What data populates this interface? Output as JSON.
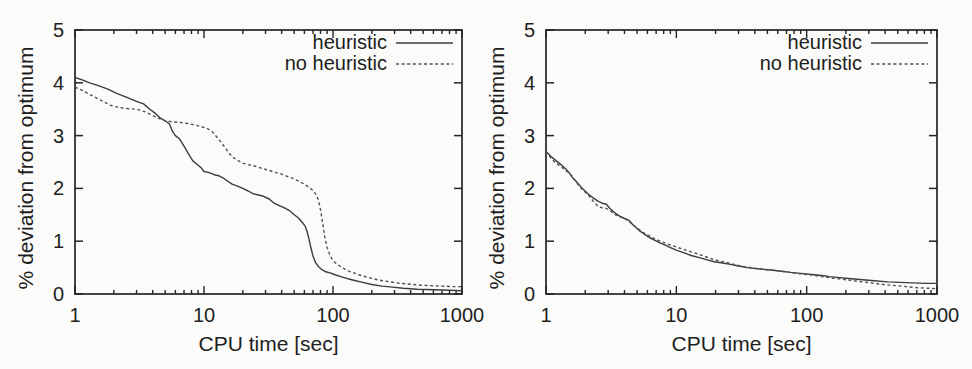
{
  "figure": {
    "background_color": "#fbfbf9",
    "ink_color": "#242424",
    "solid_line_color": "#3c3c3c",
    "dashed_line_color": "#515151"
  },
  "chart_data": [
    {
      "type": "line",
      "panel": "left",
      "title": "",
      "xlabel": "CPU time [sec]",
      "ylabel": "% deviation from optimum",
      "x_scale": "log",
      "xlim": [
        1,
        1000
      ],
      "ylim": [
        0,
        5
      ],
      "x_ticks": [
        1,
        10,
        100,
        1000
      ],
      "y_ticks": [
        0,
        1,
        2,
        3,
        4,
        5
      ],
      "grid": false,
      "legend_position": "top-right",
      "series": [
        {
          "name": "heuristic",
          "style": "solid",
          "points": [
            [
              1,
              4.1
            ],
            [
              1.15,
              4.05
            ],
            [
              1.3,
              4.0
            ],
            [
              1.5,
              3.95
            ],
            [
              1.8,
              3.88
            ],
            [
              2.1,
              3.8
            ],
            [
              2.5,
              3.73
            ],
            [
              3,
              3.65
            ],
            [
              3.4,
              3.6
            ],
            [
              3.8,
              3.5
            ],
            [
              4.2,
              3.42
            ],
            [
              4.6,
              3.33
            ],
            [
              5,
              3.28
            ],
            [
              5.4,
              3.22
            ],
            [
              5.7,
              3.08
            ],
            [
              6,
              3.0
            ],
            [
              6.5,
              2.93
            ],
            [
              7,
              2.8
            ],
            [
              7.4,
              2.7
            ],
            [
              7.8,
              2.6
            ],
            [
              8.2,
              2.52
            ],
            [
              9,
              2.44
            ],
            [
              9.6,
              2.38
            ],
            [
              10,
              2.32
            ],
            [
              11,
              2.3
            ],
            [
              12,
              2.26
            ],
            [
              13,
              2.24
            ],
            [
              14,
              2.2
            ],
            [
              15,
              2.15
            ],
            [
              16.5,
              2.08
            ],
            [
              18,
              2.05
            ],
            [
              20,
              2.0
            ],
            [
              22,
              1.95
            ],
            [
              24,
              1.9
            ],
            [
              26,
              1.88
            ],
            [
              29,
              1.85
            ],
            [
              32,
              1.8
            ],
            [
              35,
              1.72
            ],
            [
              38,
              1.68
            ],
            [
              42,
              1.63
            ],
            [
              46,
              1.58
            ],
            [
              50,
              1.5
            ],
            [
              54,
              1.44
            ],
            [
              58,
              1.35
            ],
            [
              61,
              1.28
            ],
            [
              63,
              1.18
            ],
            [
              65,
              1.05
            ],
            [
              67,
              0.9
            ],
            [
              70,
              0.72
            ],
            [
              73,
              0.6
            ],
            [
              77,
              0.52
            ],
            [
              82,
              0.46
            ],
            [
              88,
              0.42
            ],
            [
              95,
              0.4
            ],
            [
              105,
              0.36
            ],
            [
              115,
              0.33
            ],
            [
              130,
              0.29
            ],
            [
              150,
              0.25
            ],
            [
              170,
              0.22
            ],
            [
              200,
              0.18
            ],
            [
              240,
              0.15
            ],
            [
              290,
              0.13
            ],
            [
              350,
              0.11
            ],
            [
              450,
              0.09
            ],
            [
              600,
              0.08
            ],
            [
              800,
              0.07
            ],
            [
              1000,
              0.06
            ]
          ]
        },
        {
          "name": "no heuristic",
          "style": "dashed",
          "points": [
            [
              1,
              3.92
            ],
            [
              1.15,
              3.85
            ],
            [
              1.3,
              3.78
            ],
            [
              1.5,
              3.7
            ],
            [
              1.7,
              3.63
            ],
            [
              1.9,
              3.57
            ],
            [
              2.2,
              3.53
            ],
            [
              2.6,
              3.51
            ],
            [
              3,
              3.5
            ],
            [
              3.5,
              3.45
            ],
            [
              4,
              3.38
            ],
            [
              4.5,
              3.32
            ],
            [
              5,
              3.28
            ],
            [
              5.7,
              3.26
            ],
            [
              6.5,
              3.25
            ],
            [
              7.5,
              3.23
            ],
            [
              8.5,
              3.2
            ],
            [
              9.5,
              3.17
            ],
            [
              10.5,
              3.14
            ],
            [
              11.5,
              3.08
            ],
            [
              12,
              3.03
            ],
            [
              12.8,
              2.95
            ],
            [
              13.5,
              2.88
            ],
            [
              14.5,
              2.78
            ],
            [
              15.5,
              2.68
            ],
            [
              16.5,
              2.6
            ],
            [
              18,
              2.54
            ],
            [
              20,
              2.48
            ],
            [
              22,
              2.45
            ],
            [
              25,
              2.42
            ],
            [
              28,
              2.38
            ],
            [
              32,
              2.34
            ],
            [
              36,
              2.3
            ],
            [
              40,
              2.27
            ],
            [
              45,
              2.22
            ],
            [
              50,
              2.18
            ],
            [
              55,
              2.13
            ],
            [
              60,
              2.08
            ],
            [
              65,
              2.02
            ],
            [
              70,
              1.96
            ],
            [
              74,
              1.88
            ],
            [
              77,
              1.78
            ],
            [
              80,
              1.6
            ],
            [
              83,
              1.35
            ],
            [
              86,
              1.1
            ],
            [
              90,
              0.88
            ],
            [
              95,
              0.73
            ],
            [
              100,
              0.63
            ],
            [
              108,
              0.56
            ],
            [
              118,
              0.5
            ],
            [
              130,
              0.44
            ],
            [
              145,
              0.4
            ],
            [
              165,
              0.35
            ],
            [
              190,
              0.31
            ],
            [
              220,
              0.27
            ],
            [
              260,
              0.24
            ],
            [
              310,
              0.21
            ],
            [
              380,
              0.19
            ],
            [
              460,
              0.17
            ],
            [
              560,
              0.16
            ],
            [
              700,
              0.15
            ],
            [
              850,
              0.14
            ],
            [
              1000,
              0.14
            ]
          ]
        }
      ]
    },
    {
      "type": "line",
      "panel": "right",
      "title": "",
      "xlabel": "CPU time [sec]",
      "ylabel": "% deviation from optimum",
      "x_scale": "log",
      "xlim": [
        1,
        1000
      ],
      "ylim": [
        0,
        5
      ],
      "x_ticks": [
        1,
        10,
        100,
        1000
      ],
      "y_ticks": [
        0,
        1,
        2,
        3,
        4,
        5
      ],
      "grid": false,
      "legend_position": "top-right",
      "series": [
        {
          "name": "heuristic",
          "style": "solid",
          "points": [
            [
              1,
              2.7
            ],
            [
              1.1,
              2.6
            ],
            [
              1.2,
              2.52
            ],
            [
              1.3,
              2.45
            ],
            [
              1.4,
              2.38
            ],
            [
              1.5,
              2.3
            ],
            [
              1.6,
              2.2
            ],
            [
              1.75,
              2.1
            ],
            [
              1.9,
              2.0
            ],
            [
              2.1,
              1.9
            ],
            [
              2.3,
              1.82
            ],
            [
              2.5,
              1.76
            ],
            [
              2.7,
              1.72
            ],
            [
              2.9,
              1.7
            ],
            [
              3.1,
              1.62
            ],
            [
              3.4,
              1.53
            ],
            [
              3.7,
              1.47
            ],
            [
              4,
              1.43
            ],
            [
              4.3,
              1.4
            ],
            [
              4.7,
              1.3
            ],
            [
              5.2,
              1.2
            ],
            [
              5.7,
              1.13
            ],
            [
              6.2,
              1.07
            ],
            [
              6.8,
              1.02
            ],
            [
              7.5,
              0.97
            ],
            [
              8.3,
              0.92
            ],
            [
              9.2,
              0.87
            ],
            [
              10,
              0.83
            ],
            [
              11.5,
              0.78
            ],
            [
              13,
              0.73
            ],
            [
              15,
              0.69
            ],
            [
              17,
              0.65
            ],
            [
              19.5,
              0.61
            ],
            [
              22,
              0.59
            ],
            [
              26,
              0.56
            ],
            [
              30,
              0.53
            ],
            [
              35,
              0.5
            ],
            [
              42,
              0.48
            ],
            [
              50,
              0.46
            ],
            [
              60,
              0.44
            ],
            [
              75,
              0.41
            ],
            [
              90,
              0.39
            ],
            [
              110,
              0.37
            ],
            [
              130,
              0.35
            ],
            [
              150,
              0.33
            ],
            [
              180,
              0.31
            ],
            [
              220,
              0.29
            ],
            [
              270,
              0.27
            ],
            [
              330,
              0.25
            ],
            [
              420,
              0.23
            ],
            [
              520,
              0.22
            ],
            [
              650,
              0.21
            ],
            [
              820,
              0.2
            ],
            [
              1000,
              0.2
            ]
          ]
        },
        {
          "name": "no heuristic",
          "style": "dashed",
          "points": [
            [
              1,
              2.7
            ],
            [
              1.1,
              2.56
            ],
            [
              1.2,
              2.47
            ],
            [
              1.3,
              2.42
            ],
            [
              1.4,
              2.34
            ],
            [
              1.5,
              2.3
            ],
            [
              1.6,
              2.22
            ],
            [
              1.75,
              2.08
            ],
            [
              1.9,
              1.98
            ],
            [
              2.1,
              1.88
            ],
            [
              2.3,
              1.76
            ],
            [
              2.5,
              1.66
            ],
            [
              2.7,
              1.63
            ],
            [
              2.9,
              1.62
            ],
            [
              3.1,
              1.58
            ],
            [
              3.4,
              1.5
            ],
            [
              3.7,
              1.46
            ],
            [
              4,
              1.44
            ],
            [
              4.3,
              1.38
            ],
            [
              4.7,
              1.3
            ],
            [
              5.2,
              1.22
            ],
            [
              5.7,
              1.15
            ],
            [
              6.2,
              1.1
            ],
            [
              6.8,
              1.05
            ],
            [
              7.5,
              1.0
            ],
            [
              8.3,
              0.96
            ],
            [
              9.2,
              0.92
            ],
            [
              10,
              0.89
            ],
            [
              11.5,
              0.84
            ],
            [
              13,
              0.8
            ],
            [
              15,
              0.75
            ],
            [
              17,
              0.7
            ],
            [
              19.5,
              0.65
            ],
            [
              22,
              0.62
            ],
            [
              26,
              0.58
            ],
            [
              30,
              0.54
            ],
            [
              35,
              0.51
            ],
            [
              42,
              0.48
            ],
            [
              50,
              0.46
            ],
            [
              60,
              0.44
            ],
            [
              75,
              0.41
            ],
            [
              90,
              0.38
            ],
            [
              110,
              0.36
            ],
            [
              130,
              0.33
            ],
            [
              160,
              0.3
            ],
            [
              200,
              0.27
            ],
            [
              250,
              0.24
            ],
            [
              310,
              0.21
            ],
            [
              390,
              0.18
            ],
            [
              480,
              0.16
            ],
            [
              580,
              0.14
            ],
            [
              700,
              0.12
            ],
            [
              850,
              0.11
            ],
            [
              1000,
              0.1
            ]
          ]
        }
      ]
    }
  ]
}
